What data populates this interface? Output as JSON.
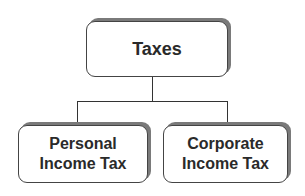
{
  "diagram": {
    "type": "org-chart",
    "root": {
      "label": "Taxes"
    },
    "children": [
      {
        "label_line1": "Personal",
        "label_line2": "Income Tax"
      },
      {
        "label_line1": "Corporate",
        "label_line2": "Income Tax"
      }
    ]
  }
}
